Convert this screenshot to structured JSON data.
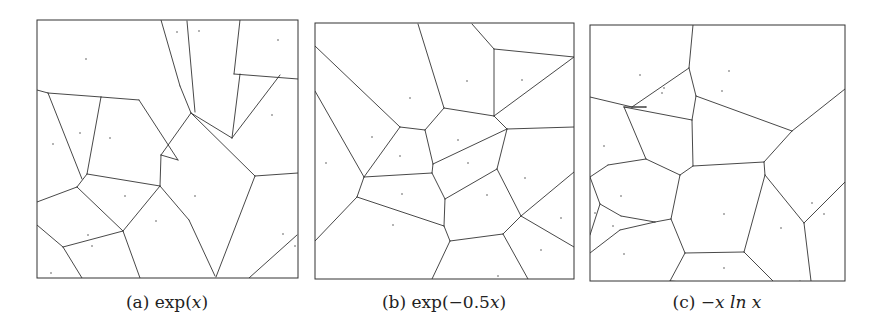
{
  "figure": {
    "panels": [
      {
        "id": "a",
        "label": "(a)",
        "func": "exp(x)",
        "caption_prefix": "(a) exp(",
        "caption_var": "x",
        "caption_suffix": ")",
        "box": [
          37,
          20,
          298,
          278
        ],
        "edges": [
          [
            161,
            20,
            180,
            86
          ],
          [
            180,
            86,
            191,
            113
          ],
          [
            191,
            113,
            232,
            138
          ],
          [
            232,
            138,
            280,
            75
          ],
          [
            240,
            74,
            232,
            138
          ],
          [
            187,
            21,
            195,
            112
          ],
          [
            240,
            20,
            234,
            74
          ],
          [
            234,
            74,
            298,
            79
          ],
          [
            191,
            113,
            161,
            155
          ],
          [
            161,
            155,
            178,
            160
          ],
          [
            178,
            160,
            139,
            100
          ],
          [
            139,
            100,
            101,
            97
          ],
          [
            101,
            97,
            48,
            93
          ],
          [
            48,
            93,
            37,
            90
          ],
          [
            101,
            97,
            87,
            174
          ],
          [
            48,
            93,
            82,
            179
          ],
          [
            161,
            155,
            160,
            186
          ],
          [
            160,
            186,
            87,
            174
          ],
          [
            87,
            174,
            77,
            187
          ],
          [
            77,
            187,
            37,
            202
          ],
          [
            77,
            187,
            123,
            231
          ],
          [
            123,
            231,
            160,
            186
          ],
          [
            160,
            186,
            189,
            220
          ],
          [
            189,
            220,
            215,
            276
          ],
          [
            191,
            113,
            255,
            176
          ],
          [
            255,
            176,
            298,
            173
          ],
          [
            255,
            176,
            216,
            277
          ],
          [
            123,
            231,
            140,
            278
          ],
          [
            123,
            231,
            63,
            247
          ],
          [
            63,
            247,
            37,
            225
          ],
          [
            63,
            247,
            82,
            278
          ],
          [
            249,
            278,
            297,
            235
          ]
        ],
        "sites": [
          [
            86,
            59
          ],
          [
            177,
            32
          ],
          [
            199,
            31
          ],
          [
            278,
            40
          ],
          [
            80,
            133
          ],
          [
            110,
            138
          ],
          [
            53,
            144
          ],
          [
            272,
            115
          ],
          [
            125,
            196
          ],
          [
            195,
            196
          ],
          [
            156,
            221
          ],
          [
            88,
            235
          ],
          [
            92,
            246
          ],
          [
            283,
            234
          ],
          [
            295,
            246
          ],
          [
            51,
            273
          ]
        ]
      },
      {
        "id": "b",
        "label": "(b)",
        "func": "exp(−0.5x)",
        "caption_prefix": "(b) exp(−0.5",
        "caption_var": "x",
        "caption_suffix": ")",
        "box": [
          315,
          23,
          574,
          279
        ],
        "edges": [
          [
            418,
            24,
            444,
            108
          ],
          [
            444,
            108,
            425,
            130
          ],
          [
            425,
            130,
            400,
            127
          ],
          [
            400,
            127,
            315,
            46
          ],
          [
            472,
            24,
            494,
            49
          ],
          [
            494,
            49,
            494,
            116
          ],
          [
            494,
            116,
            574,
            57
          ],
          [
            494,
            49,
            574,
            57
          ],
          [
            444,
            108,
            494,
            116
          ],
          [
            494,
            116,
            507,
            129
          ],
          [
            507,
            129,
            574,
            127
          ],
          [
            507,
            129,
            433,
            164
          ],
          [
            507,
            129,
            497,
            169
          ],
          [
            425,
            130,
            433,
            164
          ],
          [
            400,
            127,
            364,
            177
          ],
          [
            364,
            177,
            315,
            91
          ],
          [
            364,
            177,
            432,
            173
          ],
          [
            432,
            173,
            433,
            164
          ],
          [
            364,
            177,
            357,
            197
          ],
          [
            357,
            197,
            315,
            241
          ],
          [
            357,
            197,
            444,
            226
          ],
          [
            432,
            173,
            445,
            199
          ],
          [
            445,
            199,
            497,
            169
          ],
          [
            445,
            199,
            444,
            226
          ],
          [
            444,
            226,
            450,
            241
          ],
          [
            450,
            241,
            503,
            234
          ],
          [
            503,
            234,
            521,
            216
          ],
          [
            521,
            216,
            497,
            169
          ],
          [
            521,
            216,
            574,
            172
          ],
          [
            521,
            216,
            574,
            247
          ],
          [
            503,
            234,
            528,
            279
          ],
          [
            450,
            241,
            432,
            279
          ]
        ],
        "sites": [
          [
            410,
            98
          ],
          [
            467,
            81
          ],
          [
            522,
            80
          ],
          [
            372,
            137
          ],
          [
            400,
            156
          ],
          [
            458,
            140
          ],
          [
            468,
            163
          ],
          [
            326,
            163
          ],
          [
            402,
            194
          ],
          [
            487,
            195
          ],
          [
            525,
            178
          ],
          [
            393,
            225
          ],
          [
            561,
            218
          ],
          [
            541,
            250
          ],
          [
            498,
            276
          ]
        ]
      },
      {
        "id": "c",
        "label": "(c)",
        "func": "−x ln x",
        "caption_prefix": "(c) −",
        "caption_var": "x ln x",
        "caption_suffix": "",
        "box": [
          590,
          25,
          845,
          281
        ],
        "edges": [
          [
            693,
            25,
            689,
            68
          ],
          [
            689,
            68,
            632,
            107
          ],
          [
            632,
            107,
            590,
            97
          ],
          [
            689,
            68,
            696,
            96
          ],
          [
            696,
            96,
            692,
            120
          ],
          [
            692,
            120,
            624,
            107
          ],
          [
            624,
            107,
            646,
            107
          ],
          [
            646,
            107,
            632,
            107
          ],
          [
            696,
            96,
            792,
            131
          ],
          [
            792,
            131,
            845,
            89
          ],
          [
            792,
            131,
            764,
            162
          ],
          [
            692,
            120,
            693,
            166
          ],
          [
            646,
            107,
            646,
            107
          ],
          [
            624,
            107,
            646,
            159
          ],
          [
            646,
            159,
            680,
            175
          ],
          [
            680,
            175,
            693,
            166
          ],
          [
            693,
            166,
            764,
            162
          ],
          [
            764,
            162,
            765,
            175
          ],
          [
            646,
            159,
            608,
            165
          ],
          [
            608,
            165,
            590,
            177
          ],
          [
            680,
            175,
            671,
            219
          ],
          [
            671,
            219,
            655,
            222
          ],
          [
            655,
            222,
            621,
            216
          ],
          [
            621,
            216,
            600,
            204
          ],
          [
            600,
            204,
            590,
            177
          ],
          [
            600,
            204,
            590,
            235
          ],
          [
            655,
            222,
            620,
            230
          ],
          [
            620,
            230,
            590,
            253
          ],
          [
            671,
            219,
            685,
            253
          ],
          [
            685,
            253,
            744,
            252
          ],
          [
            744,
            252,
            765,
            175
          ],
          [
            765,
            175,
            804,
            223
          ],
          [
            804,
            223,
            845,
            182
          ],
          [
            804,
            223,
            811,
            281
          ],
          [
            744,
            252,
            782,
            290
          ],
          [
            782,
            290,
            800,
            281
          ],
          [
            685,
            253,
            670,
            281
          ],
          [
            670,
            281,
            782,
            290
          ]
        ],
        "sites": [
          [
            640,
            75
          ],
          [
            664,
            88
          ],
          [
            662,
            93
          ],
          [
            729,
            71
          ],
          [
            722,
            91
          ],
          [
            604,
            146
          ],
          [
            621,
            196
          ],
          [
            595,
            213
          ],
          [
            613,
            226
          ],
          [
            624,
            254
          ],
          [
            724,
            214
          ],
          [
            781,
            228
          ],
          [
            812,
            203
          ],
          [
            824,
            214
          ],
          [
            724,
            268
          ]
        ]
      }
    ]
  },
  "colors": {
    "background": "#ffffff",
    "line": "#333333",
    "site": "#555555",
    "caption": "#222222"
  }
}
